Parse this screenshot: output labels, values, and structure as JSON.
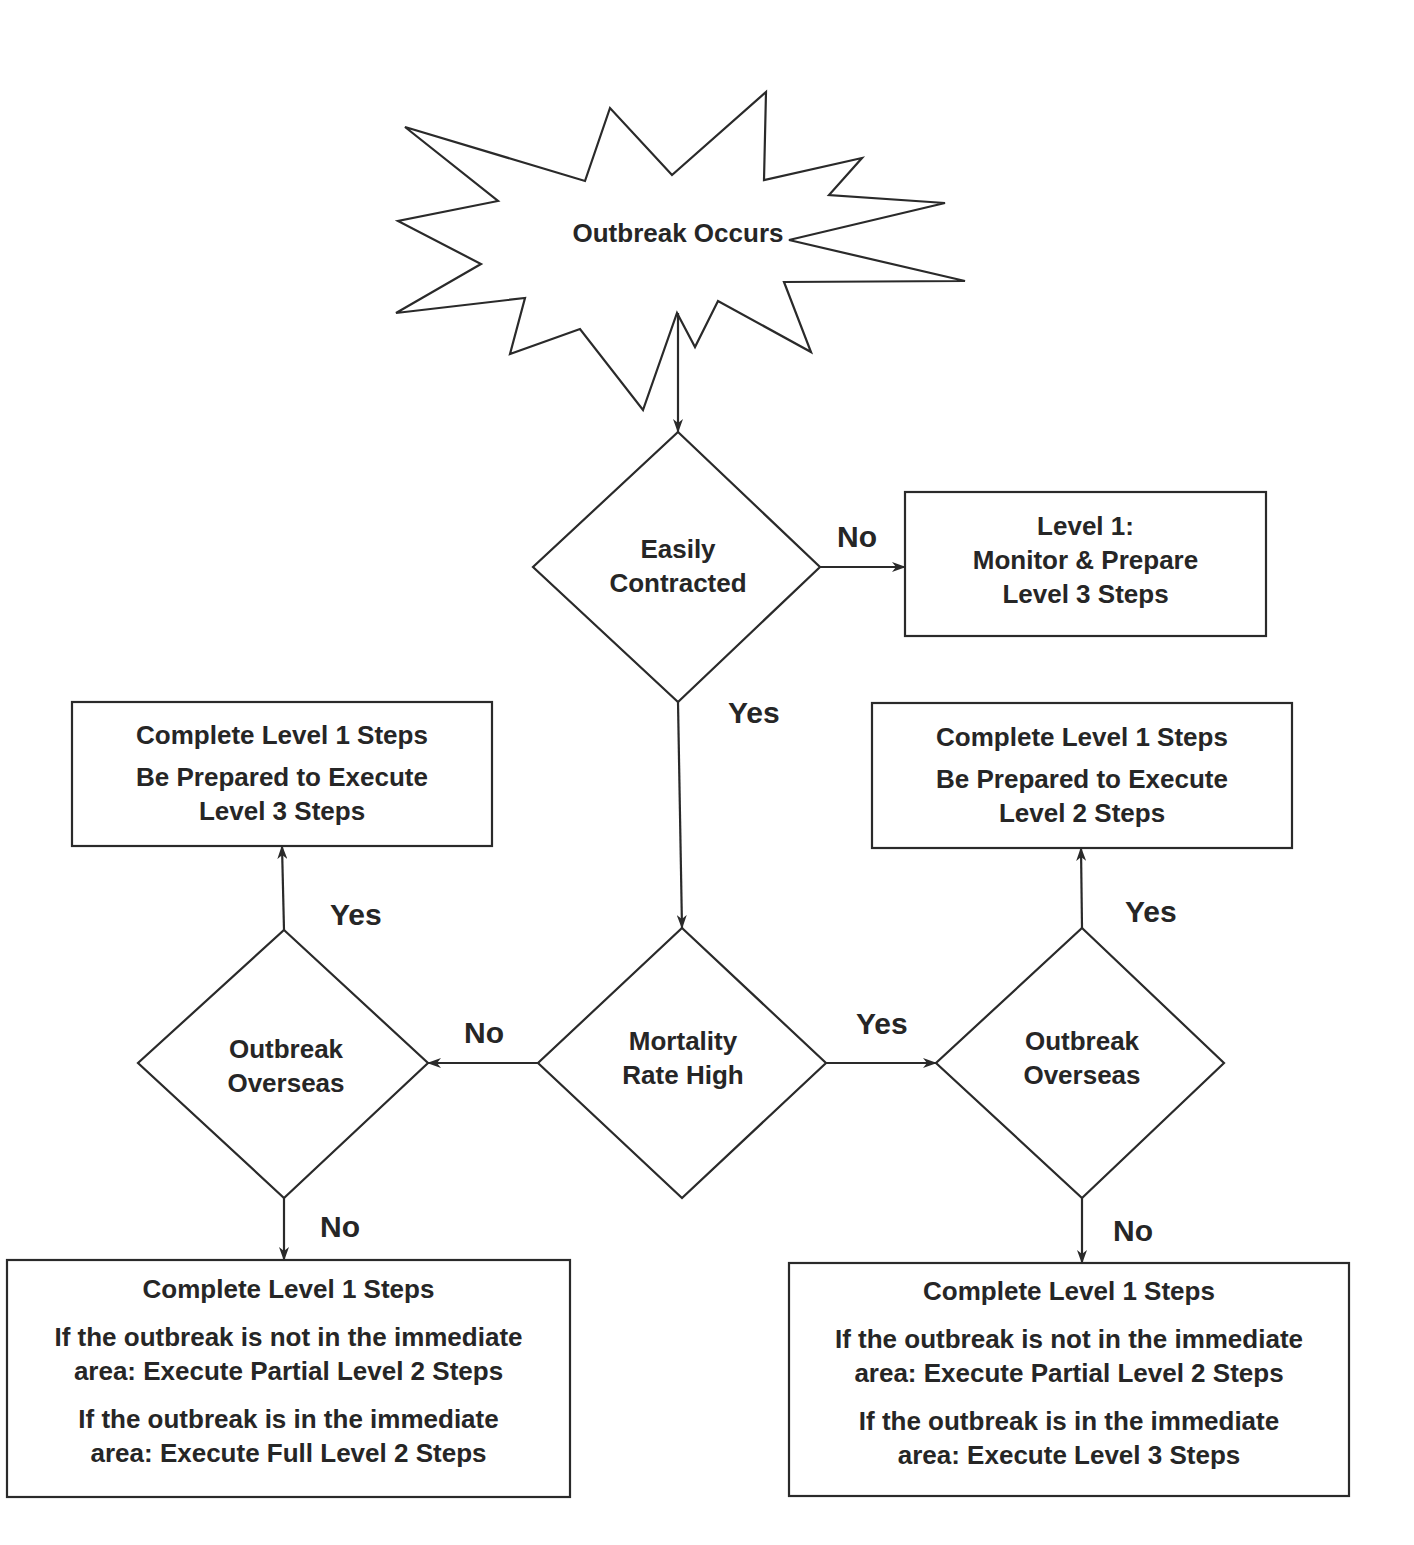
{
  "diagram": {
    "type": "flowchart",
    "start": {
      "label": "Outbreak Occurs",
      "shape": "starburst"
    },
    "decisions": {
      "easily_contracted": {
        "line1": "Easily",
        "line2": "Contracted"
      },
      "mortality": {
        "line1": "Mortality",
        "line2": "Rate High"
      },
      "overseas_left": {
        "line1": "Outbreak",
        "line2": "Overseas"
      },
      "overseas_right": {
        "line1": "Outbreak",
        "line2": "Overseas"
      }
    },
    "outcomes": {
      "level1": {
        "line1": "Level 1:",
        "line2": "Monitor & Prepare",
        "line3": "Level 3 Steps"
      },
      "left_yes": {
        "line1": "Complete Level 1 Steps",
        "line2": "Be Prepared to Execute",
        "line3": "Level 3 Steps"
      },
      "right_yes": {
        "line1": "Complete Level 1 Steps",
        "line2": "Be Prepared to Execute",
        "line3": "Level 2 Steps"
      },
      "left_no": {
        "line1": "Complete Level 1 Steps",
        "line2": "If the outbreak is not in the immediate",
        "line3": "area: Execute Partial Level 2 Steps",
        "line4": "If the outbreak is in the immediate",
        "line5": "area: Execute Full Level 2 Steps"
      },
      "right_no": {
        "line1": "Complete Level 1 Steps",
        "line2": "If the outbreak is not in the immediate",
        "line3": "area: Execute Partial Level 2 Steps",
        "line4": "If the outbreak is in the immediate",
        "line5": "area: Execute Level 3 Steps"
      }
    },
    "edge_labels": {
      "easily_no": "No",
      "easily_yes": "Yes",
      "mortality_no": "No",
      "mortality_yes": "Yes",
      "left_overseas_yes": "Yes",
      "left_overseas_no": "No",
      "right_overseas_yes": "Yes",
      "right_overseas_no": "No"
    },
    "colors": {
      "stroke": "#2a2a2a",
      "text": "#262626",
      "background": "#ffffff"
    }
  }
}
